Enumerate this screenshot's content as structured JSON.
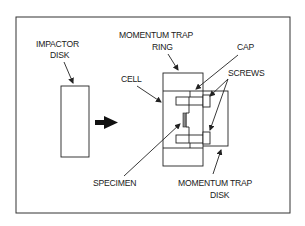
{
  "diagram": {
    "type": "schematic",
    "labels": {
      "impactor_disk_line1": "IMPACTOR",
      "impactor_disk_line2": "DISK",
      "momentum_trap_ring_line1": "MOMENTUM TRAP",
      "momentum_trap_ring_line2": "RING",
      "cap": "CAP",
      "screws": "SCREWS",
      "cell": "CELL",
      "specimen": "SPECIMEN",
      "momentum_trap_disk_line1": "MOMENTUM TRAP",
      "momentum_trap_disk_line2": "DISK"
    },
    "colors": {
      "line": "#222222",
      "background": "#ffffff",
      "specimen_fill": "#8a8a8a"
    }
  }
}
